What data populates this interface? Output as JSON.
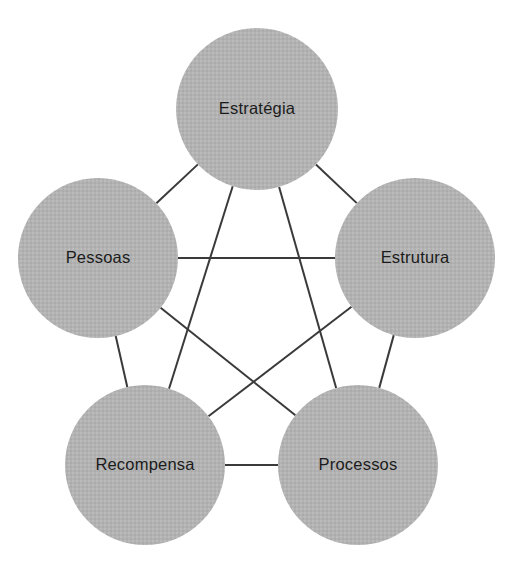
{
  "diagram": {
    "type": "node-link-pentagon",
    "shape": "complete-graph-k5",
    "colors": {
      "node_fill": "#b0b0b0",
      "node_fill_light": "#bdbdbd",
      "edge_stroke": "#3a3a3a",
      "label_text": "#1b1b1b",
      "background": "#ffffff"
    },
    "geometry": {
      "width": 513,
      "height": 567,
      "node_radius": 80
    },
    "nodes": [
      {
        "id": "estrategia",
        "label": "Estratégia",
        "cx": 257,
        "cy": 109,
        "r": 81
      },
      {
        "id": "estrutura",
        "label": "Estrutura",
        "cx": 415,
        "cy": 258,
        "r": 80
      },
      {
        "id": "processos",
        "label": "Processos",
        "cx": 358,
        "cy": 465,
        "r": 80
      },
      {
        "id": "recompensa",
        "label": "Recompensa",
        "cx": 145,
        "cy": 465,
        "r": 80
      },
      {
        "id": "pessoas",
        "label": "Pessoas",
        "cx": 98,
        "cy": 258,
        "r": 80
      }
    ],
    "edges": [
      {
        "from": "estrategia",
        "to": "estrutura",
        "kind": "perimeter"
      },
      {
        "from": "estrutura",
        "to": "processos",
        "kind": "perimeter"
      },
      {
        "from": "processos",
        "to": "recompensa",
        "kind": "perimeter"
      },
      {
        "from": "recompensa",
        "to": "pessoas",
        "kind": "perimeter"
      },
      {
        "from": "pessoas",
        "to": "estrategia",
        "kind": "perimeter"
      },
      {
        "from": "estrategia",
        "to": "processos",
        "kind": "diagonal"
      },
      {
        "from": "estrategia",
        "to": "recompensa",
        "kind": "diagonal"
      },
      {
        "from": "estrutura",
        "to": "recompensa",
        "kind": "diagonal"
      },
      {
        "from": "estrutura",
        "to": "pessoas",
        "kind": "diagonal"
      },
      {
        "from": "processos",
        "to": "pessoas",
        "kind": "diagonal"
      }
    ]
  }
}
